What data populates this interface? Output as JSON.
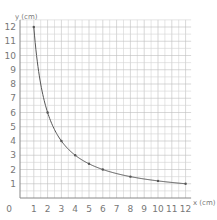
{
  "header": {
    "partial_text": ""
  },
  "chart_data": {
    "type": "line",
    "title": "",
    "xlabel": "x (cm)",
    "ylabel": "y (cm)",
    "xlim": [
      0,
      12.4
    ],
    "ylim": [
      0,
      12.5
    ],
    "x_ticks": [
      "0",
      "1",
      "2",
      "3",
      "4",
      "5",
      "6",
      "7",
      "8",
      "9",
      "10",
      "11",
      "12"
    ],
    "y_ticks": [
      "1",
      "2",
      "3",
      "4",
      "5",
      "6",
      "7",
      "8",
      "9",
      "10",
      "11",
      "12"
    ],
    "grid": true,
    "grid_minor_step": 0.5,
    "relation": "y = 12 / x",
    "series": [
      {
        "name": "xy = 12",
        "x": [
          1,
          1.5,
          2,
          3,
          4,
          5,
          6,
          8,
          10,
          12
        ],
        "y": [
          12,
          8,
          6,
          4,
          3,
          2.4,
          2,
          1.5,
          1.2,
          1
        ],
        "marked_points": [
          [
            1,
            12
          ],
          [
            2,
            6
          ],
          [
            3,
            4
          ],
          [
            4,
            3
          ],
          [
            5,
            2.4
          ],
          [
            6,
            2
          ],
          [
            8,
            1.5
          ],
          [
            10,
            1.2
          ],
          [
            12,
            1
          ]
        ]
      }
    ],
    "colors": {
      "grid": "#d4d4d4",
      "grid_major": "#bdbdbd",
      "axis": "#888888",
      "curve": "#555555"
    }
  }
}
